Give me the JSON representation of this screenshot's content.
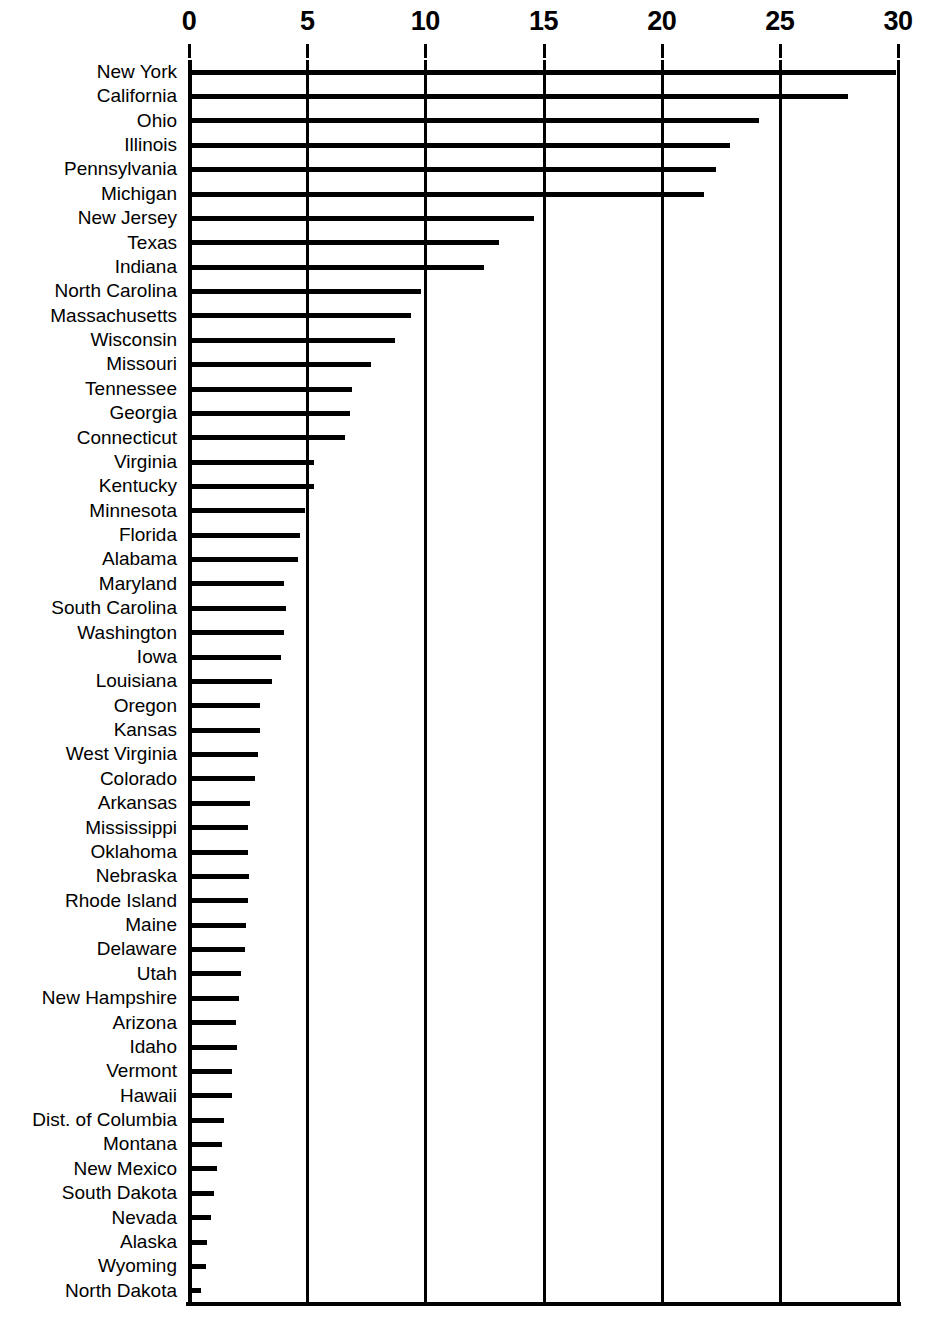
{
  "chart_data": {
    "type": "bar",
    "orientation": "horizontal",
    "title": "",
    "subtitle": "",
    "xlabel": "",
    "ylabel": "",
    "xlim": [
      0,
      30
    ],
    "ylim": null,
    "grid": "vertical gridlines at every x tick",
    "legend": null,
    "legend_position": "none",
    "xticks": [
      0,
      5,
      10,
      15,
      20,
      25,
      30
    ],
    "xtick_labels": [
      "0",
      "5",
      "10",
      "15",
      "20",
      "25",
      "30"
    ],
    "categories": [
      "New York",
      "California",
      "Ohio",
      "Illinois",
      "Pennsylvania",
      "Michigan",
      "New Jersey",
      "Texas",
      "Indiana",
      "North Carolina",
      "Massachusetts",
      "Wisconsin",
      "Missouri",
      "Tennessee",
      "Georgia",
      "Connecticut",
      "Virginia",
      "Kentucky",
      "Minnesota",
      "Florida",
      "Alabama",
      "Maryland",
      "South Carolina",
      "Washington",
      "Iowa",
      "Louisiana",
      "Oregon",
      "Kansas",
      "West Virginia",
      "Colorado",
      "Arkansas",
      "Mississippi",
      "Oklahoma",
      "Nebraska",
      "Rhode Island",
      "Maine",
      "Delaware",
      "Utah",
      "New Hampshire",
      "Arizona",
      "Idaho",
      "Vermont",
      "Hawaii",
      "Dist. of Columbia",
      "Montana",
      "New Mexico",
      "South Dakota",
      "Nevada",
      "Alaska",
      "Wyoming",
      "North Dakota"
    ],
    "values": [
      29.9,
      27.9,
      24.1,
      22.9,
      22.3,
      21.8,
      14.6,
      13.1,
      12.5,
      9.8,
      9.4,
      8.7,
      7.7,
      6.9,
      6.8,
      6.6,
      5.3,
      5.3,
      4.9,
      4.7,
      4.6,
      4.0,
      4.1,
      4.0,
      3.9,
      3.5,
      3.0,
      3.0,
      2.9,
      2.8,
      2.6,
      2.5,
      2.5,
      2.55,
      2.5,
      2.4,
      2.35,
      2.2,
      2.1,
      2.0,
      2.05,
      1.8,
      1.8,
      1.5,
      1.4,
      1.2,
      1.05,
      0.95,
      0.75,
      0.7,
      0.5
    ]
  },
  "colors": {
    "bar": "#000000",
    "grid": "#000000",
    "background": "#ffffff",
    "text": "#000000"
  }
}
